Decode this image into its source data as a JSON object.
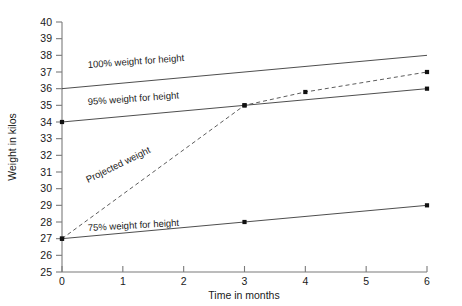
{
  "chart_data": {
    "type": "line",
    "title": "",
    "xlabel": "Time in months",
    "ylabel": "Weight in kilos",
    "xlim": [
      0,
      6
    ],
    "ylim": [
      25,
      40
    ],
    "xticks": [
      "0",
      "1",
      "2",
      "3",
      "4",
      "5",
      "6"
    ],
    "yticks": [
      "25",
      "26",
      "27",
      "28",
      "29",
      "30",
      "31",
      "32",
      "33",
      "34",
      "35",
      "36",
      "37",
      "38",
      "39",
      "40"
    ],
    "grid": false,
    "legend": "inline-labels",
    "series": [
      {
        "name": "100% weight for height",
        "style": "solid",
        "label": "100% weight for height",
        "x": [
          0,
          6
        ],
        "values": [
          36,
          38
        ],
        "markers": []
      },
      {
        "name": "95% weight for height",
        "style": "solid",
        "label": "95% weight for height",
        "x": [
          0,
          6
        ],
        "values": [
          34,
          36
        ],
        "markers": [
          {
            "x": 0,
            "y": 34
          },
          {
            "x": 3,
            "y": 35
          },
          {
            "x": 6,
            "y": 36
          }
        ]
      },
      {
        "name": "Projected weight",
        "style": "dashed",
        "label": "Projected weight",
        "x": [
          0,
          3,
          4,
          6
        ],
        "values": [
          27,
          35,
          35.8,
          37
        ],
        "markers": [
          {
            "x": 0,
            "y": 27
          },
          {
            "x": 3,
            "y": 35
          },
          {
            "x": 4,
            "y": 35.8
          },
          {
            "x": 6,
            "y": 37
          }
        ]
      },
      {
        "name": "75% weight for height",
        "style": "solid",
        "label": "75% weight for height",
        "x": [
          0,
          6
        ],
        "values": [
          27,
          29
        ],
        "markers": [
          {
            "x": 0,
            "y": 27
          },
          {
            "x": 3,
            "y": 28
          },
          {
            "x": 6,
            "y": 29
          }
        ]
      }
    ],
    "colors": {
      "line": "#3a3a3a",
      "axis": "#7a7a7a",
      "marker": "#111111",
      "background": "#ffffff"
    }
  }
}
